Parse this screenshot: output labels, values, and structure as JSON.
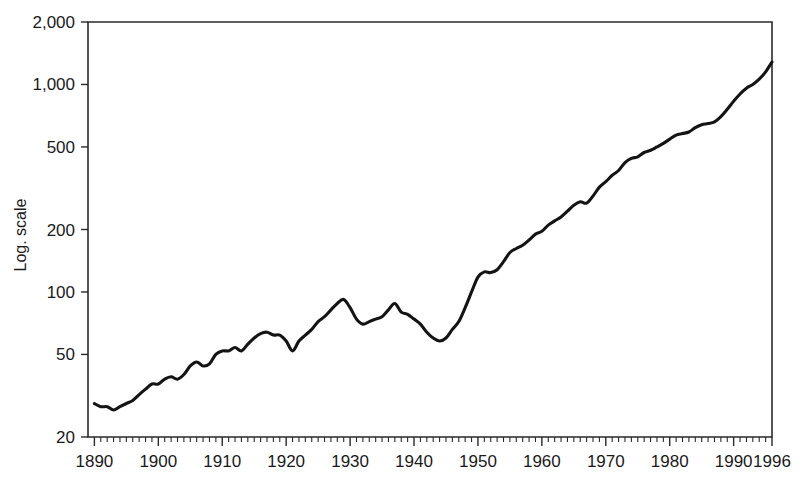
{
  "chart_data": {
    "type": "line",
    "title": "",
    "subtitle": "",
    "xlabel": "",
    "ylabel": "Log. scale",
    "yscale": "log",
    "ylim": [
      20,
      2000
    ],
    "xlim": [
      1889,
      1996
    ],
    "grid": false,
    "legend": null,
    "y_tick_labels": [
      "2,000",
      "1,000",
      "500",
      "200",
      "100",
      "50",
      "20"
    ],
    "y_ticks": [
      2000,
      1000,
      500,
      200,
      100,
      50,
      20
    ],
    "x_tick_labels": [
      "1890",
      "1900",
      "1910",
      "1920",
      "1930",
      "1940",
      "1950",
      "1960",
      "1970",
      "1980",
      "1990",
      "1996"
    ],
    "x_ticks": [
      1890,
      1900,
      1910,
      1920,
      1930,
      1940,
      1950,
      1960,
      1970,
      1980,
      1990,
      1996
    ],
    "x_minor_tick_interval": 1,
    "line_color": "#141414",
    "series": [
      {
        "name": "Index",
        "x": [
          1890,
          1891,
          1892,
          1893,
          1894,
          1895,
          1896,
          1897,
          1898,
          1899,
          1900,
          1901,
          1902,
          1903,
          1904,
          1905,
          1906,
          1907,
          1908,
          1909,
          1910,
          1911,
          1912,
          1913,
          1914,
          1915,
          1916,
          1917,
          1918,
          1919,
          1920,
          1921,
          1922,
          1923,
          1924,
          1925,
          1926,
          1927,
          1928,
          1929,
          1930,
          1931,
          1932,
          1933,
          1934,
          1935,
          1936,
          1937,
          1938,
          1939,
          1940,
          1941,
          1942,
          1943,
          1944,
          1945,
          1946,
          1947,
          1948,
          1949,
          1950,
          1951,
          1952,
          1953,
          1954,
          1955,
          1956,
          1957,
          1958,
          1959,
          1960,
          1961,
          1962,
          1963,
          1964,
          1965,
          1966,
          1967,
          1968,
          1969,
          1970,
          1971,
          1972,
          1973,
          1974,
          1975,
          1976,
          1977,
          1978,
          1979,
          1980,
          1981,
          1982,
          1983,
          1984,
          1985,
          1986,
          1987,
          1988,
          1989,
          1990,
          1991,
          1992,
          1993,
          1994,
          1995,
          1996
        ],
        "values": [
          29,
          28,
          28,
          27,
          28,
          29,
          30,
          32,
          34,
          36,
          36,
          38,
          39,
          38,
          40,
          44,
          46,
          44,
          45,
          50,
          52,
          52,
          54,
          52,
          56,
          60,
          63,
          64,
          62,
          62,
          58,
          52,
          58,
          62,
          66,
          72,
          76,
          82,
          88,
          92,
          84,
          74,
          70,
          72,
          74,
          76,
          82,
          88,
          80,
          78,
          74,
          70,
          64,
          60,
          58,
          60,
          66,
          72,
          84,
          100,
          118,
          125,
          124,
          128,
          140,
          155,
          162,
          168,
          178,
          190,
          196,
          210,
          220,
          230,
          245,
          262,
          272,
          268,
          290,
          320,
          340,
          365,
          385,
          420,
          440,
          448,
          470,
          482,
          500,
          520,
          545,
          570,
          580,
          590,
          620,
          640,
          648,
          660,
          700,
          760,
          830,
          900,
          960,
          1000,
          1060,
          1150,
          1283
        ]
      }
    ],
    "annotations": []
  },
  "axes": {
    "y_axis_label": "Log. scale"
  }
}
